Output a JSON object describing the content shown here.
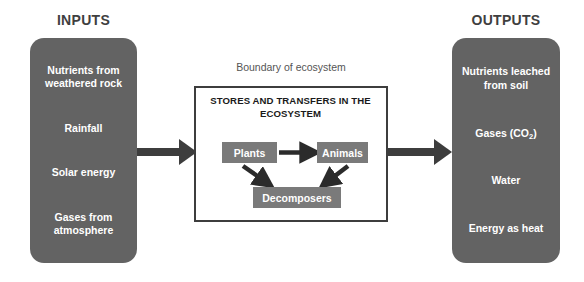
{
  "diagram": {
    "colors": {
      "panel_gray": "#636363",
      "node_gray": "#7a7a7a",
      "arrow_dark": "#3d3d3d",
      "heading_gray": "#3f3f3f",
      "boundary_label_gray": "#555555",
      "box_background": "#ffffff",
      "page_background": "#ffffff"
    }
  },
  "inputs": {
    "heading": "INPUTS",
    "items": [
      {
        "label": "Nutrients from weathered rock"
      },
      {
        "label": "Rainfall"
      },
      {
        "label": "Solar energy"
      },
      {
        "label": "Gases from atmosphere"
      }
    ]
  },
  "outputs": {
    "heading": "OUTPUTS",
    "items": [
      {
        "label": "Nutrients leached from soil",
        "subscript": ""
      },
      {
        "label": "Gases (CO",
        "subscript": "2",
        "suffix": ")"
      },
      {
        "label": "Water",
        "subscript": ""
      },
      {
        "label": "Energy as heat",
        "subscript": ""
      }
    ]
  },
  "ecosystem": {
    "boundary_label": "Boundary of ecosystem",
    "title": "STORES AND TRANSFERS IN THE ECOSYSTEM",
    "nodes": [
      {
        "id": "plants",
        "label": "Plants"
      },
      {
        "id": "animals",
        "label": "Animals"
      },
      {
        "id": "decomposers",
        "label": "Decomposers"
      }
    ],
    "flows": [
      {
        "from": "plants",
        "to": "animals"
      },
      {
        "from": "plants",
        "to": "decomposers"
      },
      {
        "from": "animals",
        "to": "decomposers"
      }
    ]
  },
  "arrows": {
    "input_arrow_label": "inputs enter ecosystem",
    "output_arrow_label": "outputs leave ecosystem"
  }
}
